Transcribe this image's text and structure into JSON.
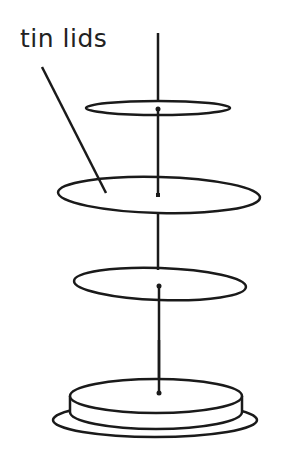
{
  "diagram": {
    "label": "tin lids",
    "stroke_color": "#1a1a1a",
    "parts": [
      {
        "name": "top-lid"
      },
      {
        "name": "middle-lid"
      },
      {
        "name": "lower-lid"
      },
      {
        "name": "base-tin"
      }
    ]
  }
}
